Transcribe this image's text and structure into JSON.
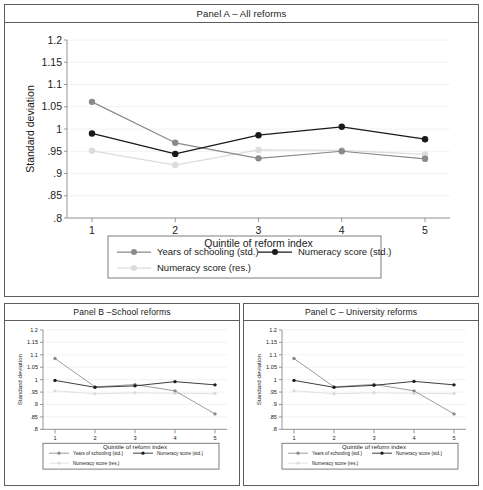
{
  "figure": {
    "panels": [
      {
        "id": "panel-a",
        "title": "Panel A – All reforms",
        "chart": {
          "type": "line",
          "title": "Panel A – All reforms",
          "xlabel": "Quintile of reform index",
          "ylabel": "Standard deviation",
          "categories": [
            "1",
            "2",
            "3",
            "4",
            "5"
          ],
          "x": [
            1,
            2,
            3,
            4,
            5
          ],
          "xlim": [
            0.7,
            5.3
          ],
          "ylim": [
            0.8,
            1.2
          ],
          "yticks": [
            0.8,
            0.85,
            0.9,
            0.95,
            1,
            1.05,
            1.1,
            1.15,
            1.2
          ],
          "ytick_labels": [
            ".8",
            ".85",
            ".9",
            ".95",
            "1",
            "1.05",
            "1.1",
            "1.15",
            "1.2"
          ],
          "xticks": [
            1,
            2,
            3,
            4,
            5
          ],
          "xtick_labels": [
            "1",
            "2",
            "3",
            "4",
            "5"
          ],
          "grid": "horizontal",
          "legend_position": "bottom",
          "series": [
            {
              "name": "Years of schooling (std.)",
              "color": "#8a8a8a",
              "marker": "circle",
              "values": [
                1.061,
                0.969,
                0.934,
                0.95,
                0.933
              ]
            },
            {
              "name": "Numeracy score (std.)",
              "color": "#1a1a1a",
              "marker": "circle",
              "values": [
                0.99,
                0.944,
                0.986,
                1.005,
                0.977
              ]
            },
            {
              "name": "Numeracy score (res.)",
              "color": "#dcdcdc",
              "marker": "circle",
              "values": [
                0.951,
                0.919,
                0.953,
                0.952,
                0.943
              ]
            }
          ]
        }
      },
      {
        "id": "panel-b",
        "title": "Panel B –School reforms",
        "chart": {
          "type": "line",
          "title": "Panel B –School reforms",
          "xlabel": "Quintile of reform index",
          "ylabel": "Standard deviation",
          "categories": [
            "1",
            "2",
            "3",
            "4",
            "5"
          ],
          "x": [
            1,
            2,
            3,
            4,
            5
          ],
          "xlim": [
            0.7,
            5.3
          ],
          "ylim": [
            0.8,
            1.2
          ],
          "yticks": [
            0.8,
            0.85,
            0.9,
            0.95,
            1,
            1.05,
            1.1,
            1.15,
            1.2
          ],
          "ytick_labels": [
            ".8",
            ".85",
            ".9",
            ".95",
            "1",
            "1.05",
            "1.1",
            "1.15",
            "1.2"
          ],
          "xticks": [
            1,
            2,
            3,
            4,
            5
          ],
          "xtick_labels": [
            "1",
            "2",
            "3",
            "4",
            "5"
          ],
          "grid": "horizontal",
          "legend_position": "bottom",
          "series": [
            {
              "name": "Years of schooling (std.)",
              "color": "#8a8a8a",
              "marker": "circle",
              "values": [
                1.085,
                0.971,
                0.98,
                0.955,
                0.862
              ]
            },
            {
              "name": "Numeracy score (std.)",
              "color": "#1a1a1a",
              "marker": "circle",
              "values": [
                0.997,
                0.969,
                0.975,
                0.992,
                0.979
              ]
            },
            {
              "name": "Numeracy score (res.)",
              "color": "#dcdcdc",
              "marker": "circle",
              "values": [
                0.955,
                0.943,
                0.947,
                0.945,
                0.944
              ]
            }
          ]
        }
      },
      {
        "id": "panel-c",
        "title": "Panel C – University reforms",
        "chart": {
          "type": "line",
          "title": "Panel C – University reforms",
          "xlabel": "Quintile of reform index",
          "ylabel": "Standard deviation",
          "categories": [
            "1",
            "2",
            "3",
            "4",
            "5"
          ],
          "x": [
            1,
            2,
            3,
            4,
            5
          ],
          "xlim": [
            0.7,
            5.3
          ],
          "ylim": [
            0.8,
            1.2
          ],
          "yticks": [
            0.8,
            0.85,
            0.9,
            0.95,
            1,
            1.05,
            1.1,
            1.15,
            1.2
          ],
          "ytick_labels": [
            ".8",
            ".85",
            ".9",
            ".95",
            "1",
            "1.05",
            "1.1",
            "1.15",
            "1.2"
          ],
          "xticks": [
            1,
            2,
            3,
            4,
            5
          ],
          "xtick_labels": [
            "1",
            "2",
            "3",
            "4",
            "5"
          ],
          "grid": "horizontal",
          "legend_position": "bottom",
          "series": [
            {
              "name": "Years of schooling (std.)",
              "color": "#8a8a8a",
              "marker": "circle",
              "values": [
                1.085,
                0.971,
                0.981,
                0.955,
                0.862
              ]
            },
            {
              "name": "Numeracy score (std.)",
              "color": "#1a1a1a",
              "marker": "circle",
              "values": [
                0.997,
                0.969,
                0.977,
                0.993,
                0.979
              ]
            },
            {
              "name": "Numeracy score (res.)",
              "color": "#dcdcdc",
              "marker": "circle",
              "values": [
                0.955,
                0.943,
                0.947,
                0.945,
                0.944
              ]
            }
          ]
        }
      }
    ]
  },
  "chart_data": [
    {
      "type": "line",
      "title": "Panel A – All reforms",
      "xlabel": "Quintile of reform index",
      "ylabel": "Standard deviation",
      "categories": [
        "1",
        "2",
        "3",
        "4",
        "5"
      ],
      "x": [
        1,
        2,
        3,
        4,
        5
      ],
      "xlim": [
        0.7,
        5.3
      ],
      "ylim": [
        0.8,
        1.2
      ],
      "yticks": [
        0.8,
        0.85,
        0.9,
        0.95,
        1,
        1.05,
        1.1,
        1.15,
        1.2
      ],
      "grid": "horizontal",
      "legend_position": "bottom",
      "series": [
        {
          "name": "Years of schooling (std.)",
          "values": [
            1.061,
            0.969,
            0.934,
            0.95,
            0.933
          ]
        },
        {
          "name": "Numeracy score (std.)",
          "values": [
            0.99,
            0.944,
            0.986,
            1.005,
            0.977
          ]
        },
        {
          "name": "Numeracy score (res.)",
          "values": [
            0.951,
            0.919,
            0.953,
            0.952,
            0.943
          ]
        }
      ]
    },
    {
      "type": "line",
      "title": "Panel B –School reforms",
      "xlabel": "Quintile of reform index",
      "ylabel": "Standard deviation",
      "categories": [
        "1",
        "2",
        "3",
        "4",
        "5"
      ],
      "x": [
        1,
        2,
        3,
        4,
        5
      ],
      "xlim": [
        0.7,
        5.3
      ],
      "ylim": [
        0.8,
        1.2
      ],
      "yticks": [
        0.8,
        0.85,
        0.9,
        0.95,
        1,
        1.05,
        1.1,
        1.15,
        1.2
      ],
      "grid": "horizontal",
      "legend_position": "bottom",
      "series": [
        {
          "name": "Years of schooling (std.)",
          "values": [
            1.085,
            0.971,
            0.98,
            0.955,
            0.862
          ]
        },
        {
          "name": "Numeracy score (std.)",
          "values": [
            0.997,
            0.969,
            0.975,
            0.992,
            0.979
          ]
        },
        {
          "name": "Numeracy score (res.)",
          "values": [
            0.955,
            0.943,
            0.947,
            0.945,
            0.944
          ]
        }
      ]
    },
    {
      "type": "line",
      "title": "Panel C – University reforms",
      "xlabel": "Quintile of reform index",
      "ylabel": "Standard deviation",
      "categories": [
        "1",
        "2",
        "3",
        "4",
        "5"
      ],
      "x": [
        1,
        2,
        3,
        4,
        5
      ],
      "xlim": [
        0.7,
        5.3
      ],
      "ylim": [
        0.8,
        1.2
      ],
      "yticks": [
        0.8,
        0.85,
        0.9,
        0.95,
        1,
        1.05,
        1.1,
        1.15,
        1.2
      ],
      "grid": "horizontal",
      "legend_position": "bottom",
      "series": [
        {
          "name": "Years of schooling (std.)",
          "values": [
            1.085,
            0.971,
            0.981,
            0.955,
            0.862
          ]
        },
        {
          "name": "Numeracy score (std.)",
          "values": [
            0.997,
            0.969,
            0.977,
            0.993,
            0.979
          ]
        },
        {
          "name": "Numeracy score (res.)",
          "values": [
            0.955,
            0.943,
            0.947,
            0.945,
            0.944
          ]
        }
      ]
    }
  ],
  "colors": {
    "series_schooling": "#8a8a8a",
    "series_numeracy_std": "#1a1a1a",
    "series_numeracy_res": "#dcdcdc",
    "frame": "#5d5d5d",
    "grid": "#efefef",
    "axis": "#8a8a8a"
  }
}
